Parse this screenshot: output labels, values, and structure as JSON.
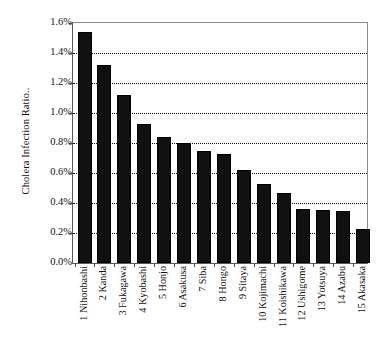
{
  "chart_data": {
    "type": "bar",
    "title": "",
    "xlabel": "",
    "ylabel": "Cholera Infection Ratio..",
    "ylim": [
      0,
      1.6
    ],
    "ytick_labels": [
      "1.6%",
      "1.4%",
      "1.2%",
      "1.0%",
      "0.8%",
      "0.6%",
      "0.4%",
      "0.2%",
      "0.0%"
    ],
    "ytick_values": [
      1.6,
      1.4,
      1.2,
      1.0,
      0.8,
      0.6,
      0.4,
      0.2,
      0.0
    ],
    "grid": true,
    "grid_style": "dotted-horizontal",
    "legend": "none",
    "unit": "%",
    "categories": [
      "1 Nihonbashi",
      "2 Kanda",
      "3 Fukagawa",
      "4 Kyobashi",
      "5 Honjo",
      "6 Asakusa",
      "7 Siba",
      "8 Hongo",
      "9 Sitaya",
      "10 Kojimachi",
      "11 Koishikawa",
      "12 Ushigome",
      "13 Yotsuya",
      "14 Azabu",
      "15 Akasaka"
    ],
    "values": [
      1.54,
      1.32,
      1.12,
      0.93,
      0.84,
      0.8,
      0.745,
      0.73,
      0.62,
      0.525,
      0.47,
      0.36,
      0.355,
      0.35,
      0.23
    ],
    "value_labels": [
      "1.54%",
      "1.32%",
      "1.12%",
      "0.93%",
      "0.84%",
      "0.80%",
      "0.745%",
      "0.73%",
      "0.62%",
      "0.525%",
      "0.47%",
      "0.36%",
      "0.355%",
      "0.35%",
      "0.23%"
    ],
    "series_color": "#111111",
    "grid_color": "#000000",
    "axis_color": "#5a5a5a",
    "background_color": "#ffffff"
  }
}
